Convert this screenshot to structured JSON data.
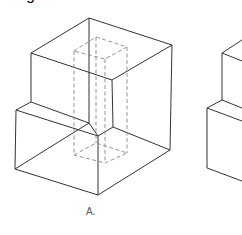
{
  "heading": {
    "visible_fragment": "g"
  },
  "figures": [
    {
      "id": "A",
      "label": "A.",
      "description": "Isometric cube with a notch step on the lower-left and a dashed hidden square prism through the center",
      "label_pos": {
        "x": 86,
        "y": 208
      }
    },
    {
      "id": "B",
      "label": "",
      "description": "Second stepped cube, cut off at the right edge"
    }
  ],
  "colors": {
    "line": "#333333",
    "hidden_line": "#888888",
    "background": "#ffffff"
  }
}
